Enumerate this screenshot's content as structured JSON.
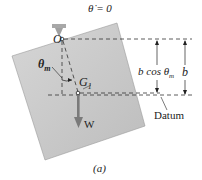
{
  "figure": {
    "caption": "(a)",
    "theta_dot_label": "θ̇ = 0",
    "pivot_label": "O",
    "angle_label": "θ",
    "angle_sub": "m",
    "cg_label": "G",
    "cg_sub": "1",
    "weight_label": "W",
    "dim_inner_label": "b cos θ",
    "dim_inner_sub": "m",
    "dim_outer_label": "b",
    "datum_label": "Datum",
    "colors": {
      "block_fill": "#c8c8c8",
      "block_edge": "#9a9a9a",
      "dash": "#333333",
      "weight_arrow": "#7a7a7a",
      "support": "#a0a0a0"
    }
  }
}
